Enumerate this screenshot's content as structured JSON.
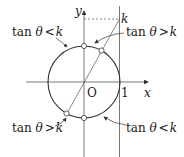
{
  "diagram": {
    "axes": {
      "x_label": "x",
      "y_label": "y",
      "origin_label": "O",
      "one_label": "1"
    },
    "k_label": "k",
    "annotations": [
      {
        "id": "top-left",
        "text": "tan θ < k",
        "prefix": "tan ",
        "theta": "θ",
        "op": "<",
        "k": "k"
      },
      {
        "id": "top-right",
        "text": "tan θ > k",
        "prefix": "tan ",
        "theta": "θ",
        "op": ">",
        "k": "k"
      },
      {
        "id": "bottom-left",
        "text": "tan θ > k",
        "prefix": "tan ",
        "theta": "θ",
        "op": ">",
        "k": "k"
      },
      {
        "id": "bottom-right",
        "text": "tan θ < k",
        "prefix": "tan ",
        "theta": "θ",
        "op": "<",
        "k": "k"
      }
    ],
    "colors": {
      "stroke": "#333333",
      "text": "#222222",
      "background": "#ffffff"
    }
  }
}
